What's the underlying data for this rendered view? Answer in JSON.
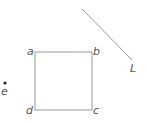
{
  "diagram": {
    "square": {
      "x": 35,
      "y": 52,
      "width": 57,
      "height": 58,
      "stroke": "#9a9a9a",
      "vertices": {
        "a": "a",
        "b": "b",
        "c": "c",
        "d": "d"
      }
    },
    "line": {
      "x1": 82,
      "y1": 9,
      "x2": 132,
      "y2": 60,
      "label": "L",
      "stroke": "#9a9a9a"
    },
    "point": {
      "cx": 5,
      "cy": 83,
      "label": "e",
      "fill": "#222222"
    }
  }
}
